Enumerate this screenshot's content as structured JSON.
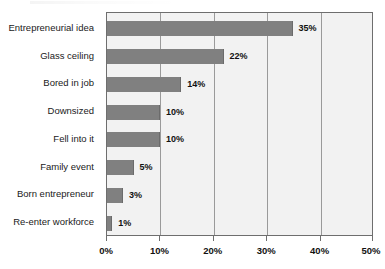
{
  "chart_data": {
    "type": "bar",
    "orientation": "horizontal",
    "title": "",
    "xlabel": "",
    "ylabel": "",
    "xlim": [
      0,
      50
    ],
    "xticks": [
      0,
      10,
      20,
      30,
      40,
      50
    ],
    "xtick_labels": [
      "0%",
      "10%",
      "20%",
      "30%",
      "40%",
      "50%"
    ],
    "grid": "vertical",
    "legend": "none",
    "categories": [
      "Entrepreneurial idea",
      "Glass ceiling",
      "Bored in job",
      "Downsized",
      "Fell into it",
      "Family event",
      "Born entrepreneur",
      "Re-enter workforce"
    ],
    "values": [
      35,
      22,
      14,
      10,
      10,
      5,
      3,
      1
    ],
    "value_labels": [
      "35%",
      "22%",
      "14%",
      "10%",
      "10%",
      "5%",
      "3%",
      "1%"
    ],
    "bar_color": "#808080",
    "plot_background": "#f2f2f2",
    "gridline_color": "#9a9a9a",
    "axis_color": "#6e6e6e"
  }
}
